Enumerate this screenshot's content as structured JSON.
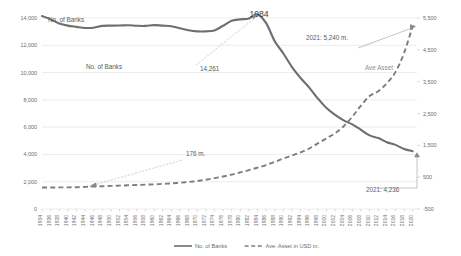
{
  "chart_data": {
    "type": "line",
    "title": "",
    "xlabel": "",
    "ylabel": "No. of Banks",
    "y2label": "Ave. Asset in USD m.",
    "grid": true,
    "legend_position": "bottom",
    "ylim": [
      0,
      14000
    ],
    "y2lim": [
      -500,
      5500
    ],
    "yticks": [
      "0",
      "2,000",
      "4,000",
      "6,000",
      "8,000",
      "10,000",
      "12,000",
      "14,000"
    ],
    "y2ticks": [
      "-500",
      "500",
      "1,500",
      "2,500",
      "3,500",
      "4,500",
      "5,500"
    ],
    "x": [
      1934,
      1936,
      1938,
      1940,
      1942,
      1944,
      1946,
      1948,
      1950,
      1952,
      1954,
      1956,
      1958,
      1960,
      1962,
      1964,
      1966,
      1968,
      1970,
      1972,
      1974,
      1976,
      1978,
      1980,
      1982,
      1984,
      1986,
      1988,
      1990,
      1992,
      1994,
      1996,
      1998,
      2000,
      2002,
      2004,
      2006,
      2008,
      2010,
      2012,
      2014,
      2016,
      2018,
      2020
    ],
    "categories": [
      "1934",
      "1936",
      "1938",
      "1940",
      "1942",
      "1944",
      "1946",
      "1948",
      "1950",
      "1952",
      "1954",
      "1956",
      "1958",
      "1960",
      "1962",
      "1964",
      "1966",
      "1968",
      "1970",
      "1972",
      "1974",
      "1976",
      "1978",
      "1980",
      "1982",
      "1984",
      "1986",
      "1988",
      "1990",
      "1992",
      "1994",
      "1996",
      "1998",
      "2000",
      "2002",
      "2004",
      "2006",
      "2008",
      "2010",
      "2012",
      "2014",
      "2016",
      "2018",
      "2020"
    ],
    "series": [
      {
        "name": "No. of Banks",
        "axis": "left",
        "style": "solid",
        "color": "#6e6e6e",
        "values": [
          14146,
          13900,
          13600,
          13440,
          13350,
          13270,
          13290,
          13420,
          13440,
          13450,
          13470,
          13430,
          13420,
          13480,
          13440,
          13400,
          13250,
          13100,
          13020,
          13020,
          13090,
          13430,
          13800,
          13900,
          13960,
          14261,
          13620,
          12300,
          11400,
          10400,
          9600,
          8900,
          8100,
          7400,
          6900,
          6500,
          6200,
          5800,
          5400,
          5200,
          4900,
          4700,
          4400,
          4236
        ],
        "label_peak": {
          "year": 1984,
          "value": 14261
        },
        "label_end": {
          "year": 2021,
          "value": 4236
        }
      },
      {
        "name": "Ave. Asset in USD m.",
        "axis": "right",
        "style": "dashed",
        "color": "#7d7d7d",
        "values": [
          176,
          176,
          178,
          180,
          185,
          195,
          205,
          215,
          225,
          235,
          245,
          255,
          265,
          275,
          290,
          305,
          325,
          350,
          380,
          420,
          470,
          520,
          580,
          650,
          720,
          800,
          880,
          980,
          1090,
          1180,
          1280,
          1400,
          1560,
          1720,
          1880,
          2100,
          2400,
          2750,
          3050,
          3200,
          3450,
          3800,
          4400,
          5240
        ],
        "label_start": {
          "year": 1934,
          "value": 176,
          "text": "176 m."
        },
        "label_end": {
          "year": 2021,
          "value": 5240,
          "text": "2021: 5,240 m."
        }
      }
    ],
    "annotations": [
      {
        "id": "peak-year",
        "text": "1984",
        "kind": "callout-large"
      },
      {
        "id": "peak-value",
        "text": "14,261",
        "kind": "callout"
      },
      {
        "id": "banks-series-label-top",
        "text": "No. of Banks",
        "kind": "inline-label"
      },
      {
        "id": "banks-series-label-mid",
        "text": "No. of Banks",
        "kind": "inline-label"
      },
      {
        "id": "asset-series-label",
        "text": "Ave Asset",
        "kind": "inline-label"
      },
      {
        "id": "asset-start-value",
        "text": "176 m.",
        "kind": "callout"
      },
      {
        "id": "asset-end-value",
        "text": "2021: 5,240 m.",
        "kind": "callout"
      },
      {
        "id": "banks-end-value",
        "text": "2021: 4,236",
        "kind": "callout"
      }
    ],
    "legend": [
      {
        "label": "No. of Banks",
        "style": "solid",
        "color": "#6e6e6e"
      },
      {
        "label": "Ave. Asset in USD m.",
        "style": "dashed",
        "color": "#7d7d7d"
      }
    ]
  }
}
